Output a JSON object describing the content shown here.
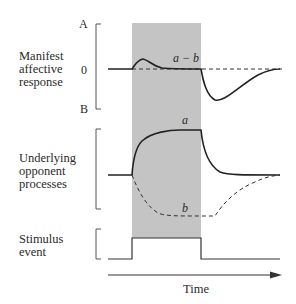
{
  "diagram": {
    "panels": [
      {
        "title_lines": [
          "Manifest",
          "affective",
          "response"
        ],
        "ticks": {
          "top": "A",
          "middle": "0",
          "bottom": "B"
        },
        "curve_label": "a − b"
      },
      {
        "title_lines": [
          "Underlying",
          "opponent",
          "processes"
        ],
        "curve_labels": {
          "solid": "a",
          "dashed": "b"
        }
      },
      {
        "title_lines": [
          "Stimulus",
          "event"
        ]
      }
    ],
    "x_axis_label": "Time",
    "colors": {
      "shade": "#c4c4c4",
      "line": "#2a2a2a"
    }
  }
}
